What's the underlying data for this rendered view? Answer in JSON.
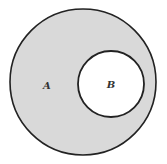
{
  "diagram": {
    "type": "venn",
    "colors": {
      "background": "#ffffff",
      "outer_fill": "#d9d9d9",
      "inner_fill": "#ffffff",
      "stroke": "#222222"
    },
    "sets": [
      {
        "label": "A",
        "shape": "circle",
        "cx": 83,
        "cy": 82,
        "r": 73,
        "shaded": true
      },
      {
        "label": "B",
        "shape": "circle",
        "cx": 111,
        "cy": 84,
        "r": 33,
        "shaded": false
      }
    ]
  }
}
